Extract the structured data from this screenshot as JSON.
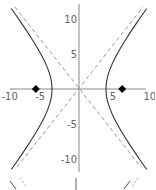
{
  "chart_data": {
    "type": "line",
    "title": "",
    "xlabel": "",
    "ylabel": "",
    "xlim": [
      -10,
      10
    ],
    "ylim": [
      -12,
      12
    ],
    "grid": false,
    "legend": null,
    "x_ticks": [
      -10,
      -5,
      5,
      10
    ],
    "y_ticks": [
      10,
      5,
      -5,
      -10
    ],
    "x_tick_labels": [
      "-10",
      "-5",
      "5",
      "10"
    ],
    "y_tick_labels": [
      "10",
      "5",
      "-5",
      "-10"
    ],
    "series": [
      {
        "name": "hyperbola",
        "equation": "x^2/16 - y^2/25 = 1",
        "style": "solid",
        "color": "#333333",
        "vertices": [
          [
            -4,
            0
          ],
          [
            4,
            0
          ]
        ]
      },
      {
        "name": "asymptote y = 1.25x",
        "style": "dashed",
        "color": "#888888",
        "slope": 1.25
      },
      {
        "name": "asymptote y = -1.25x",
        "style": "dashed",
        "color": "#888888",
        "slope": -1.25
      },
      {
        "name": "foci",
        "style": "diamond-markers",
        "color": "#000000",
        "points": [
          [
            -6.4,
            0
          ],
          [
            6.4,
            0
          ]
        ]
      }
    ]
  }
}
